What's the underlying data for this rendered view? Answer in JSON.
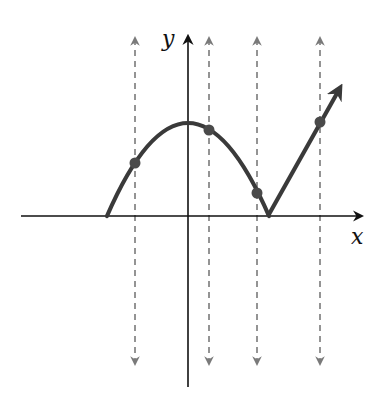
{
  "diagram": {
    "type": "vertical-line-test",
    "axes": {
      "x_label": "x",
      "y_label": "y",
      "origin_px": [
        188,
        216
      ]
    },
    "curve": {
      "description": "Downward parabola from left x-intercept up to vertex on y-axis, down to a cusp on the x-axis, then a straight ray rising up-right with arrowhead",
      "left_intercept_px": [
        107,
        216
      ],
      "vertex_px": [
        188,
        123
      ],
      "cusp_px": [
        268,
        216
      ],
      "ray_end_px": [
        342,
        83
      ],
      "color": "#3a3a3a"
    },
    "vertical_lines": [
      {
        "x_px": 135,
        "intersection_px": [
          135,
          163
        ]
      },
      {
        "x_px": 209,
        "intersection_px": [
          209,
          130
        ]
      },
      {
        "x_px": 257,
        "intersection_px": [
          257,
          193
        ]
      },
      {
        "x_px": 320,
        "intersection_px": [
          320,
          122
        ]
      }
    ],
    "vertical_line_style": {
      "dashed": true,
      "double_arrow": true,
      "color": "#7a7a7a",
      "top_px": 38,
      "bottom_px": 364
    },
    "point_color": "#4a4a4a",
    "axis_color": "#111111"
  }
}
